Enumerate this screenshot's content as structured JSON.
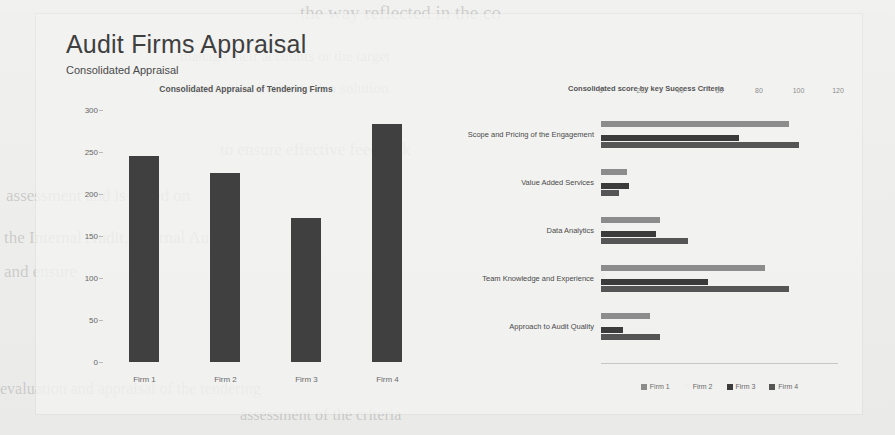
{
  "page": {
    "title": "Audit Firms Appraisal",
    "subtitle": "Consolidated Appraisal"
  },
  "ghost": [
    {
      "text": "the way reflected in the co",
      "x": 300,
      "y": 2,
      "size": 19
    },
    {
      "text": "manage their accounts or the target",
      "x": 180,
      "y": 48,
      "size": 15
    },
    {
      "text": "organisation in line with a solution",
      "x": 180,
      "y": 80,
      "size": 15
    },
    {
      "text": "to ensure effective feedback",
      "x": 220,
      "y": 140,
      "size": 17
    },
    {
      "text": "assessment and is based on",
      "x": 6,
      "y": 186,
      "size": 17
    },
    {
      "text": "the Internal Audit, Internal Audit",
      "x": 4,
      "y": 228,
      "size": 17
    },
    {
      "text": "and ensure",
      "x": 4,
      "y": 262,
      "size": 17
    },
    {
      "text": "evaluation and appraisal of the tendering",
      "x": 0,
      "y": 380,
      "size": 16
    },
    {
      "text": "assessment of the criteria",
      "x": 240,
      "y": 406,
      "size": 16
    }
  ],
  "colors": {
    "firm1": "#8c8c8c",
    "firm2": "#efefed",
    "firm3": "#3b3b3b",
    "firm4": "#555555",
    "bar_left": "#404040"
  },
  "chart_data": [
    {
      "type": "bar",
      "title": "Consolidated Appraisal of Tendering Firms",
      "categories": [
        "Firm 1",
        "Firm 2",
        "Firm 3",
        "Firm 4"
      ],
      "values": [
        245,
        225,
        172,
        283
      ],
      "xlabel": "",
      "ylabel": "",
      "ylim": [
        0,
        300
      ],
      "yticks": [
        300,
        250,
        200,
        150,
        100,
        50,
        0
      ],
      "grid": false,
      "legend": "none"
    },
    {
      "type": "bar",
      "orientation": "horizontal",
      "title": "Consolidated score by key Success Criteria",
      "categories": [
        "Scope and Pricing of the Engagement",
        "Value Added Services",
        "Data Analytics",
        "Team Knowledge and Experience",
        "Approach to Audit Quality"
      ],
      "series": [
        {
          "name": "Firm 1",
          "values": [
            95,
            13,
            30,
            83,
            25
          ]
        },
        {
          "name": "Firm 2",
          "values": [
            2,
            1,
            2,
            2,
            1
          ]
        },
        {
          "name": "Firm 3",
          "values": [
            70,
            14,
            28,
            54,
            11
          ]
        },
        {
          "name": "Firm 4",
          "values": [
            100,
            9,
            44,
            95,
            30
          ]
        }
      ],
      "xlabel": "",
      "ylabel": "",
      "xlim": [
        0,
        120
      ],
      "xticks": [
        0,
        20,
        40,
        60,
        80,
        100,
        120
      ],
      "grid": false,
      "legend": "bottom"
    }
  ]
}
